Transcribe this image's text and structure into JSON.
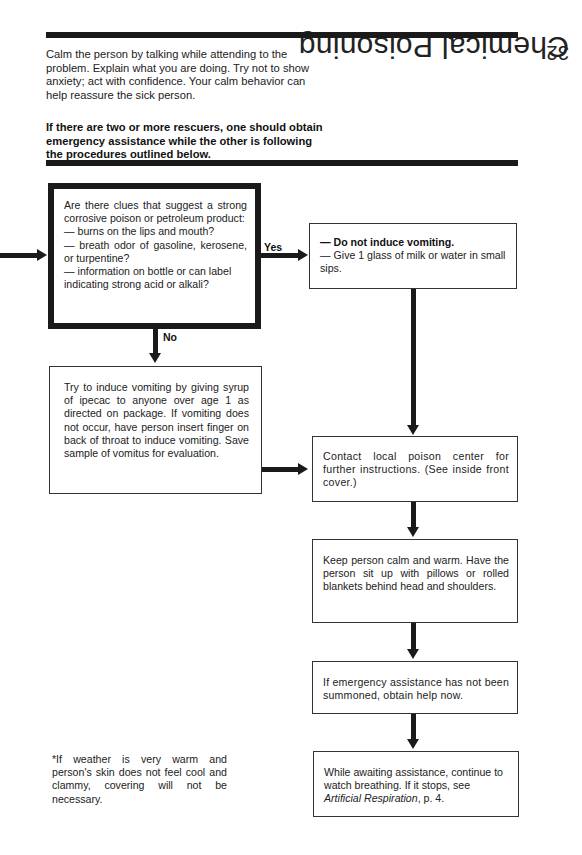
{
  "header": {
    "page_number": "32",
    "section_title": "Chemical Poisoning"
  },
  "intro": {
    "paragraph": "Calm the person by talking while attending to the problem. Explain what you are doing. Try not to show anxiety; act with confidence. Your calm behavior can help reassure the sick person.",
    "bold_paragraph": "If there are two or more rescuers, one should obtain emergency assistance while the other is following the procedures outlined below."
  },
  "flowchart": {
    "decision": {
      "intro": "Are there clues that suggest a strong corrosive poison or petroleum product:",
      "items": [
        "— burns on the lips and mouth?",
        "— breath odor of gasoline, kerosene, or turpentine?",
        "— information on bottle or can label indicating strong acid or alkali?"
      ]
    },
    "yes_label": "Yes",
    "no_label": "No",
    "yes_box": {
      "line1": "— Do not induce vomiting.",
      "line2": "— Give 1 glass of milk or water in small sips."
    },
    "no_box": "Try to induce vomiting by giving syrup of ipecac to anyone over age 1 as directed on package. If vomiting does not occur, have person insert finger on back of throat to induce vomiting. Save sample of vomitus for evaluation.",
    "contact_box": "Contact local poison center for further instructions. (See inside front cover.)",
    "calm_box": "Keep person calm and warm. Have the person sit up with pillows or rolled blankets behind head and shoulders.",
    "emergency_box": "If emergency assistance has not been summoned, obtain help now.",
    "awaiting_box": {
      "text_before": "While awaiting assistance, continue to watch breathing. If it stops, see ",
      "italic_ref": "Artificial Respiration",
      "text_after": ", p. 4."
    }
  },
  "footnote": "*If weather is very warm and person's skin does not feel cool and clammy, covering will not be necessary."
}
